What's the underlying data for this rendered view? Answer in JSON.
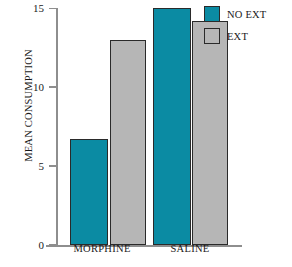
{
  "chart_data": {
    "type": "bar",
    "title": "",
    "xlabel": "",
    "ylabel": "MEAN CONSUMPTION",
    "categories": [
      "MORPHINE",
      "SALINE"
    ],
    "series": [
      {
        "name": "NO EXT",
        "color": "#0b8ba3",
        "values": [
          6.7,
          15.0
        ]
      },
      {
        "name": "EXT",
        "color": "#b6b6b6",
        "values": [
          13.0,
          14.2
        ]
      }
    ],
    "ylim": [
      0,
      15
    ],
    "yticks": [
      0,
      5,
      10,
      15
    ],
    "ytick_labels": [
      "0",
      "5",
      "10",
      "15"
    ],
    "grid": false,
    "legend_position": "top-right",
    "legend": [
      {
        "label": "NO EXT",
        "color": "#0b8ba3"
      },
      {
        "label": "EXT",
        "color": "#b6b6b6"
      }
    ]
  },
  "colors": {
    "series_no_ext": "#0b8ba3",
    "series_ext": "#b6b6b6",
    "bar_border": "#2a2a2a",
    "axis": "#8e8e8e",
    "text": "#1a1a1a",
    "background": "#ffffff"
  }
}
